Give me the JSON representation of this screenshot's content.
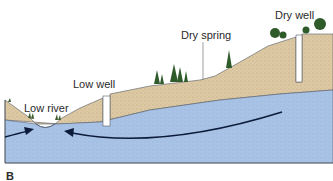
{
  "labels": {
    "low_river": "Low river",
    "low_well": "Low well",
    "dry_spring": "Dry spring",
    "dry_well": "Dry well"
  },
  "panel_label": "B",
  "colors": {
    "sand": "#dcc9a3",
    "groundwater": "#a9c3e6",
    "outline": "#555a66",
    "arrow": "#0d1b3a",
    "tree": "#2f5a2a"
  }
}
